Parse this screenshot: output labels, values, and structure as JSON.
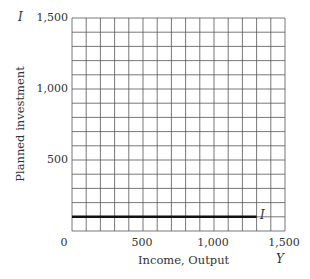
{
  "chart_data": {
    "type": "line",
    "title": "",
    "xlabel": "Income, Output",
    "ylabel": "Planned investment",
    "x_axis_symbol": "Y",
    "y_axis_symbol": "I",
    "xlim": [
      0,
      1500
    ],
    "ylim": [
      0,
      1500
    ],
    "x_ticks": [
      "0",
      "500",
      "1,000",
      "1,500"
    ],
    "y_ticks": [
      "500",
      "1,000",
      "1,500"
    ],
    "grid": true,
    "grid_step": 100,
    "series": [
      {
        "name": "I",
        "x": [
          0,
          1300
        ],
        "values": [
          100,
          100
        ],
        "label": "I"
      }
    ],
    "legend": "none"
  },
  "labels": {
    "y_symbol": "I",
    "x_symbol": "Y",
    "ylabel": "Planned investment",
    "xlabel": "Income, Output",
    "origin": "0",
    "x_tick_500": "500",
    "x_tick_1000": "1,000",
    "x_tick_1500": "1,500",
    "y_tick_500": "500",
    "y_tick_1000": "1,000",
    "y_tick_1500": "1,500",
    "line_label": "I"
  }
}
